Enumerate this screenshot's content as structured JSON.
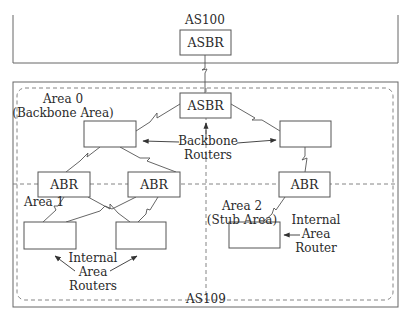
{
  "autonomous_systems": {
    "external": {
      "label": "AS100",
      "router": "ASBR"
    },
    "internal": {
      "label": "AS109"
    }
  },
  "areas": {
    "area0": {
      "line1": "Area 0",
      "line2": "(Backbone Area)"
    },
    "area1": {
      "line1": "Area 1"
    },
    "area2": {
      "line1": "Area 2",
      "line2": "(Stub Area)"
    }
  },
  "routers": {
    "asbr": "ASBR",
    "abr_left": "ABR",
    "abr_middle": "ABR",
    "abr_right": "ABR",
    "backbone_left": "",
    "backbone_right": "",
    "internal_left": "",
    "internal_middle": "",
    "internal_area2": ""
  },
  "annotations": {
    "backbone_routers": {
      "line1": "Backbone",
      "line2": "Routers"
    },
    "internal_area_routers": {
      "line1": "Internal",
      "line2": "Area",
      "line3": "Routers"
    },
    "internal_area_router": {
      "line1": "Internal",
      "line2": "Area",
      "line3": "Router"
    }
  },
  "colors": {
    "stroke": "#555555",
    "text": "#2a2a2a"
  }
}
